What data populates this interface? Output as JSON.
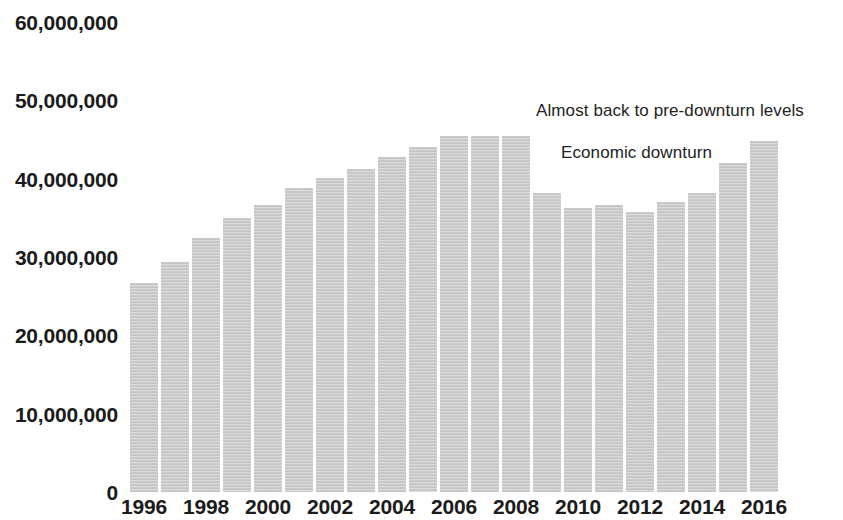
{
  "chart_data": {
    "type": "bar",
    "title": "",
    "subtitle": "",
    "xlabel": "",
    "ylabel": "",
    "grid": false,
    "legend_position": "none",
    "ylim": [
      0,
      60000000
    ],
    "ytick_labels": [
      "0",
      "10,000,000",
      "20,000,000",
      "30,000,000",
      "40,000,000",
      "50,000,000",
      "60,000,000"
    ],
    "ytick_values": [
      0,
      10000000,
      20000000,
      30000000,
      40000000,
      50000000,
      60000000
    ],
    "xtick_labels": [
      "1996",
      "1998",
      "2000",
      "2002",
      "2004",
      "2006",
      "2008",
      "2010",
      "2012",
      "2014",
      "2016"
    ],
    "categories": [
      "1996",
      "1997",
      "1998",
      "1999",
      "2000",
      "2001",
      "2002",
      "2003",
      "2004",
      "2005",
      "2006",
      "2007",
      "2008",
      "2009",
      "2010",
      "2011",
      "2012",
      "2013",
      "2014",
      "2015",
      "2016"
    ],
    "values": [
      26700000,
      29300000,
      32400000,
      35000000,
      36700000,
      38800000,
      40100000,
      41200000,
      42800000,
      44000000,
      45500000,
      45500000,
      45500000,
      38200000,
      36200000,
      36600000,
      35800000,
      37000000,
      38200000,
      42000000,
      44800000
    ],
    "series": [
      {
        "name": "value",
        "values": [
          26700000,
          29300000,
          32400000,
          35000000,
          36700000,
          38800000,
          40100000,
          41200000,
          42800000,
          44000000,
          45500000,
          45500000,
          45500000,
          38200000,
          36200000,
          36600000,
          35800000,
          37000000,
          38200000,
          42000000,
          44800000
        ]
      }
    ],
    "bar_color": "#cacaca",
    "text_color": "#1b1b1b",
    "annotations": [
      {
        "id": "recovery",
        "text": "Almost back to pre-downturn levels"
      },
      {
        "id": "downturn",
        "text": "Economic downturn"
      }
    ]
  }
}
